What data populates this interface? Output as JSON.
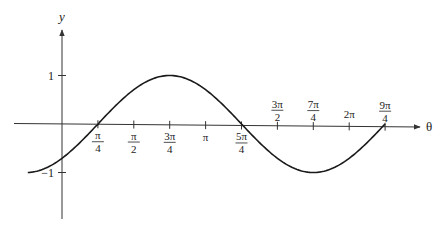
{
  "chart_data": {
    "type": "line",
    "title": "",
    "xlabel": "θ",
    "ylabel": "y",
    "function": "y = sin(θ − π/4)",
    "xlim_radians": [
      -0.785398,
      7.068583
    ],
    "ylim": [
      -1,
      1
    ],
    "grid": false,
    "legend": null,
    "y_ticks": [
      {
        "value": 1,
        "label": "1"
      },
      {
        "value": -1,
        "label": "−1"
      }
    ],
    "x_ticks": [
      {
        "value_over_pi": 0.25,
        "num": "π",
        "den": "4",
        "position": "below"
      },
      {
        "value_over_pi": 0.5,
        "num": "π",
        "den": "2",
        "position": "below"
      },
      {
        "value_over_pi": 0.75,
        "num": "3π",
        "den": "4",
        "position": "below"
      },
      {
        "value_over_pi": 1.0,
        "num": "π",
        "den": "",
        "position": "below"
      },
      {
        "value_over_pi": 1.25,
        "num": "5π",
        "den": "4",
        "position": "below"
      },
      {
        "value_over_pi": 1.5,
        "num": "3π",
        "den": "2",
        "position": "above"
      },
      {
        "value_over_pi": 1.75,
        "num": "7π",
        "den": "4",
        "position": "above"
      },
      {
        "value_over_pi": 2.0,
        "num": "2π",
        "den": "",
        "position": "above"
      },
      {
        "value_over_pi": 2.25,
        "num": "9π",
        "den": "4",
        "position": "above"
      }
    ],
    "series": [
      {
        "name": "sin(θ − π/4)",
        "x_over_pi": [
          -0.25,
          0,
          0.25,
          0.5,
          0.75,
          1.0,
          1.25,
          1.5,
          1.75,
          2.0,
          2.25
        ],
        "values": [
          -1,
          -0.707,
          0,
          0.707,
          1,
          0.707,
          0,
          -0.707,
          -1,
          -0.707,
          0
        ]
      }
    ]
  },
  "axes": {
    "x_label": "θ",
    "y_label": "y"
  },
  "colors": {
    "curve": "#1a1a1a",
    "axis": "#333333",
    "background": "#ffffff"
  }
}
